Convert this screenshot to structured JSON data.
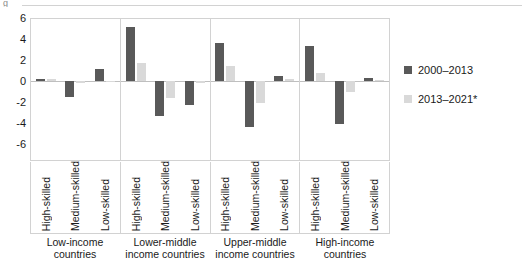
{
  "top_artifact": "g",
  "legend": {
    "position": "right",
    "entries": [
      {
        "label": "2000–2013",
        "color": "#595959",
        "swatch_name": "legend-swatch-series-1"
      },
      {
        "label": "2013–2021*",
        "color": "#d9d9d9",
        "swatch_name": "legend-swatch-series-2"
      }
    ]
  },
  "axis": {
    "yticks": [
      "6",
      "4",
      "2",
      "0",
      "-2",
      "-4",
      "-6"
    ],
    "ymin": -6,
    "ymax": 6
  },
  "chart_data": {
    "type": "bar",
    "title": "",
    "subtitle": "",
    "xlabel": "",
    "ylabel": "",
    "ylim": [
      -6,
      6
    ],
    "ytick_values": [
      6,
      4,
      2,
      0,
      -2,
      -4,
      -6
    ],
    "grid": false,
    "legend_position": "right",
    "orientation": "vertical",
    "grouping": "grouped",
    "groups": [
      {
        "label": "Low-income countries",
        "categories": [
          "High-skilled",
          "Medium-skilled",
          "Low-skilled"
        ],
        "values_2000_2013": [
          0.2,
          -1.5,
          1.1
        ],
        "values_2013_2021": [
          0.15,
          -0.15,
          -0.1
        ]
      },
      {
        "label": "Lower-middle income countries",
        "categories": [
          "High-skilled",
          "Medium-skilled",
          "Low-skilled"
        ],
        "values_2000_2013": [
          5.1,
          -3.3,
          -2.3
        ],
        "values_2013_2021": [
          1.7,
          -1.6,
          -0.15
        ]
      },
      {
        "label": "Upper-middle income countries",
        "categories": [
          "High-skilled",
          "Medium-skilled",
          "Low-skilled"
        ],
        "values_2000_2013": [
          3.6,
          -4.4,
          0.5
        ],
        "values_2013_2021": [
          1.4,
          -2.1,
          0.15
        ]
      },
      {
        "label": "High-income countries",
        "categories": [
          "High-skilled",
          "Medium-skilled",
          "Low-skilled"
        ],
        "values_2000_2013": [
          3.3,
          -4.1,
          0.25
        ],
        "values_2013_2021": [
          0.8,
          -1.0,
          0.05
        ]
      }
    ],
    "series": [
      {
        "name": "2000–2013",
        "color": "#595959",
        "values": [
          0.2,
          -1.5,
          1.1,
          5.1,
          -3.3,
          -2.3,
          3.6,
          -4.4,
          0.5,
          3.3,
          -4.1,
          0.25
        ]
      },
      {
        "name": "2013–2021*",
        "color": "#d9d9d9",
        "values": [
          0.15,
          -0.15,
          -0.1,
          1.7,
          -1.6,
          -0.15,
          1.4,
          -2.1,
          0.15,
          0.8,
          -1.0,
          0.05
        ]
      }
    ],
    "categories": [
      "Low-income countries / High-skilled",
      "Low-income countries / Medium-skilled",
      "Low-income countries / Low-skilled",
      "Lower-middle income countries / High-skilled",
      "Lower-middle income countries / Medium-skilled",
      "Lower-middle income countries / Low-skilled",
      "Upper-middle income countries / High-skilled",
      "Upper-middle income countries / Medium-skilled",
      "Upper-middle income countries / Low-skilled",
      "High-income countries / High-skilled",
      "High-income countries / Medium-skilled",
      "High-income countries / Low-skilled"
    ]
  }
}
